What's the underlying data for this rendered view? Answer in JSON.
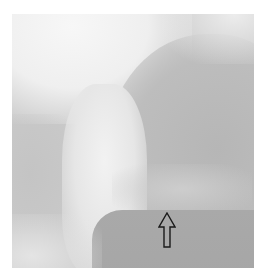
{
  "image": {
    "kind": "grayscale radiograph",
    "annotation": {
      "type": "arrow",
      "direction": "up",
      "style": "outlined",
      "color": "#1a1a1a",
      "position_px": {
        "x": 158,
        "y": 212,
        "width": 18,
        "height": 36
      }
    },
    "colors": {
      "background": "#ffffff",
      "bright_region": "#f2f2f2",
      "mid_gray": "#c4c4c4",
      "dark_region": "#a8a8a8"
    }
  }
}
